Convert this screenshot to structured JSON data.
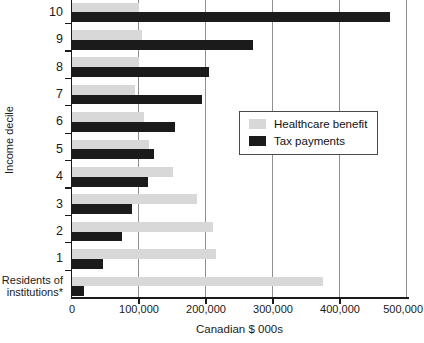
{
  "colors": {
    "healthcare_bar": "#d8d8d8",
    "tax_bar": "#1b1b1b",
    "gridline": "#8f8f8f",
    "axis": "#1a1a1a",
    "text": "#1a1a1a",
    "legend_border": "#4a4a4a",
    "background": "#ffffff"
  },
  "chart_data": {
    "type": "bar",
    "orientation": "horizontal",
    "title": "",
    "xlabel": "Canadian $ 000s",
    "ylabel": "Income decile",
    "xlim": [
      0,
      500000
    ],
    "xticks": [
      0,
      100000,
      200000,
      300000,
      400000,
      500000
    ],
    "xtick_labels": [
      "0",
      "100,000",
      "200,000",
      "300,000",
      "400,000",
      "500,000"
    ],
    "grid": true,
    "categories": [
      "10",
      "9",
      "8",
      "7",
      "6",
      "5",
      "4",
      "3",
      "2",
      "1",
      "Residents of institutions*"
    ],
    "category_label_lines": [
      [
        "10"
      ],
      [
        "9"
      ],
      [
        "8"
      ],
      [
        "7"
      ],
      [
        "6"
      ],
      [
        "5"
      ],
      [
        "4"
      ],
      [
        "3"
      ],
      [
        "2"
      ],
      [
        "1"
      ],
      [
        "Residents of",
        "institutions*"
      ]
    ],
    "series": [
      {
        "name": "Healthcare benefit",
        "color": "#d8d8d8",
        "values": [
          100000,
          105000,
          100000,
          94000,
          107000,
          115000,
          150000,
          186000,
          210000,
          215000,
          375000
        ]
      },
      {
        "name": "Tax payments",
        "color": "#1b1b1b",
        "values": [
          475000,
          270000,
          205000,
          194000,
          154000,
          123000,
          113000,
          89000,
          75000,
          47000,
          18000
        ]
      }
    ],
    "legend": {
      "position": "center-right",
      "entries": [
        "Healthcare benefit",
        "Tax payments"
      ]
    }
  }
}
